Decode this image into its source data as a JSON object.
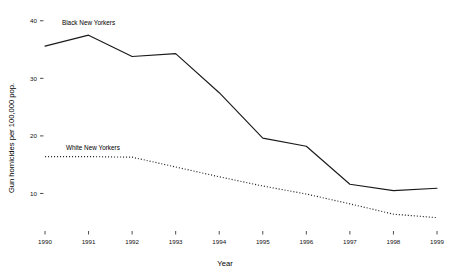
{
  "chart_data": {
    "type": "line",
    "title": "",
    "xlabel": "Year",
    "ylabel": "Gun homicides per 100,000 pop.",
    "x": [
      1990,
      1991,
      1992,
      1993,
      1994,
      1995,
      1996,
      1997,
      1998,
      1999
    ],
    "xticklabels": [
      "1990",
      "1991",
      "1992",
      "1993",
      "1994",
      "1995",
      "1996",
      "1997",
      "1998",
      "1999"
    ],
    "yticks": [
      10,
      20,
      30,
      40
    ],
    "yticklabels": [
      "10",
      "20",
      "30",
      "40"
    ],
    "xlim": [
      1990,
      1999
    ],
    "ylim": [
      4,
      41
    ],
    "grid": false,
    "legend": "inline-labels",
    "series": [
      {
        "name": "Black New Yorkers",
        "style": "solid",
        "color": "#1a1a1a",
        "label_x": 1991,
        "label_y": 39.2,
        "values": [
          35.6,
          37.5,
          33.8,
          34.3,
          27.5,
          19.6,
          18.2,
          11.6,
          10.5,
          10.9
        ]
      },
      {
        "name": "White New Yorkers",
        "style": "dotted",
        "color": "#2b2b2b",
        "label_x": 1991.1,
        "label_y": 17.6,
        "values": [
          16.4,
          16.4,
          16.3,
          14.6,
          12.9,
          11.3,
          9.9,
          8.2,
          6.4,
          5.8
        ]
      }
    ]
  },
  "axis": {
    "y_title": "Gun homicides per 100,000 pop.",
    "x_title": "Year"
  }
}
